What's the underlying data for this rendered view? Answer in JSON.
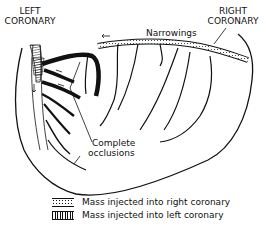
{
  "figure": {
    "labels": {
      "left_coronary": [
        "LEFT",
        "CORONARY"
      ],
      "right_coronary": [
        "RIGHT",
        "CORONARY"
      ],
      "narrowings": "Narrowings",
      "complete_occlusions": [
        "Complete",
        "occlusions"
      ]
    },
    "legend": [
      {
        "pattern": "dotted",
        "text": "Mass injected into right coronary"
      },
      {
        "pattern": "vertical-striped",
        "text": "Mass injected into left coronary"
      }
    ],
    "colors": {
      "ink": "#111111",
      "background": "#ffffff"
    }
  }
}
